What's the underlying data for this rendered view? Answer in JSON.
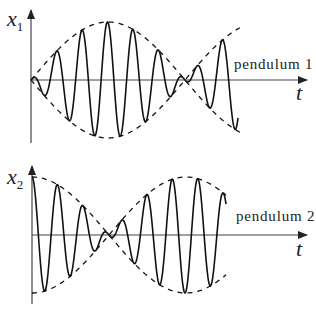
{
  "figure": {
    "plots": [
      {
        "id": "pendulum-1",
        "y_label": "x",
        "y_label_sub": "1",
        "x_label": "t",
        "curve_label": "pendulum 1",
        "envelope": "abs-sine",
        "axis": {
          "x0": 31,
          "y0": 80,
          "x_end": 307,
          "y_top": 8,
          "y_bottom": 143
        },
        "amplitude_px": 58,
        "envelope_halfperiod_px": 77,
        "carrier_period_px": 25.5,
        "curve_end_x": 238,
        "envelope_end_x": 240
      },
      {
        "id": "pendulum-2",
        "y_label": "x",
        "y_label_sub": "2",
        "x_label": "t",
        "curve_label": "pendulum 2",
        "envelope": "abs-cosine",
        "axis": {
          "x0": 32,
          "y0": 235,
          "x_end": 307,
          "y_top": 164,
          "y_bottom": 304
        },
        "amplitude_px": 58,
        "envelope_halfperiod_px": 77,
        "carrier_period_px": 25.5,
        "curve_end_x": 226,
        "envelope_end_x": 226
      }
    ],
    "colors": {
      "curve": "#111111",
      "axis": "#444444",
      "text": "#222222"
    }
  }
}
